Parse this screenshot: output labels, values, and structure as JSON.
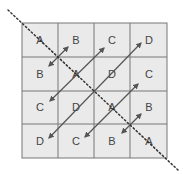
{
  "diagram": {
    "grid": {
      "rows": 4,
      "cols": 4,
      "cells": [
        [
          "A",
          "B",
          "C",
          "D"
        ],
        [
          "B",
          "A",
          "D",
          "C"
        ],
        [
          "C",
          "D",
          "A",
          "B"
        ],
        [
          "D",
          "C",
          "B",
          "A"
        ]
      ]
    },
    "colors": {
      "cell_fill": "#eaeaea",
      "grid_line": "#777777",
      "arrow": "#555555",
      "dotted_diagonal": "#333333",
      "label": "#444444"
    },
    "annotations": {
      "dotted_line": "main diagonal (top-left to bottom-right)",
      "arrows": "double-headed arrows perpendicular to the main diagonal, connecting symmetric cells"
    }
  }
}
